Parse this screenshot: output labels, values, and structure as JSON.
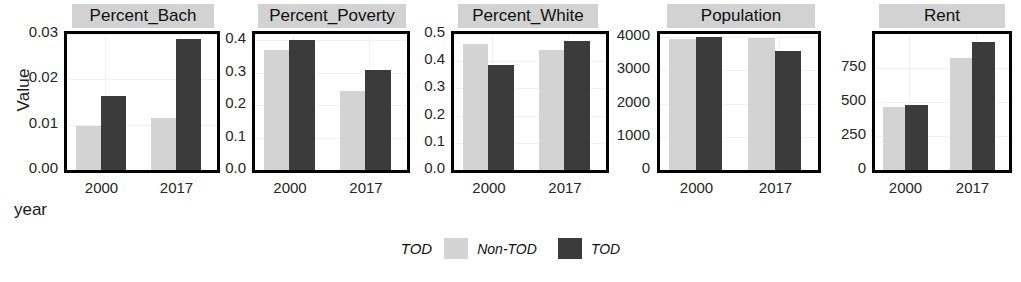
{
  "chart_data": {
    "type": "bar",
    "title": "",
    "xlabel": "year",
    "ylabel": "Value",
    "grid": true,
    "legend_position": "bottom",
    "legend_title": "TOD",
    "categories": [
      "2000",
      "2017"
    ],
    "series": [
      {
        "name": "Non-TOD",
        "color": "#d3d3d3"
      },
      {
        "name": "TOD",
        "color": "#3b3b3b"
      }
    ],
    "panels": [
      {
        "title": "Percent_Bach",
        "ylim": [
          0,
          0.03
        ],
        "yticks": [
          "0.00",
          "0.01",
          "0.02",
          "0.03"
        ],
        "ytick_values": [
          0,
          0.01,
          0.02,
          0.03
        ],
        "values": {
          "Non-TOD": [
            0.0097,
            0.0115
          ],
          "TOD": [
            0.0163,
            0.0288
          ]
        }
      },
      {
        "title": "Percent_Poverty",
        "ylim": [
          0,
          0.42
        ],
        "yticks": [
          "0.0",
          "0.1",
          "0.2",
          "0.3",
          "0.4"
        ],
        "ytick_values": [
          0,
          0.1,
          0.2,
          0.3,
          0.4
        ],
        "values": {
          "Non-TOD": [
            0.37,
            0.245
          ],
          "TOD": [
            0.402,
            0.308
          ]
        }
      },
      {
        "title": "Percent_White",
        "ylim": [
          0,
          0.5
        ],
        "yticks": [
          "0.0",
          "0.1",
          "0.2",
          "0.3",
          "0.4",
          "0.5"
        ],
        "ytick_values": [
          0,
          0.1,
          0.2,
          0.3,
          0.4,
          0.5
        ],
        "values": {
          "Non-TOD": [
            0.465,
            0.443
          ],
          "TOD": [
            0.385,
            0.476
          ]
        }
      },
      {
        "title": "Population",
        "ylim": [
          0,
          4100
        ],
        "yticks": [
          "0",
          "1000",
          "2000",
          "3000",
          "4000"
        ],
        "ytick_values": [
          0,
          1000,
          2000,
          3000,
          4000
        ],
        "values": {
          "Non-TOD": [
            3950,
            3975
          ],
          "TOD": [
            4010,
            3600
          ]
        }
      },
      {
        "title": "Rent",
        "ylim": [
          0,
          1000
        ],
        "yticks": [
          "0",
          "250",
          "500",
          "750"
        ],
        "ytick_values": [
          0,
          250,
          500,
          750
        ],
        "values": {
          "Non-TOD": [
            465,
            822
          ],
          "TOD": [
            477,
            940
          ]
        }
      }
    ]
  }
}
